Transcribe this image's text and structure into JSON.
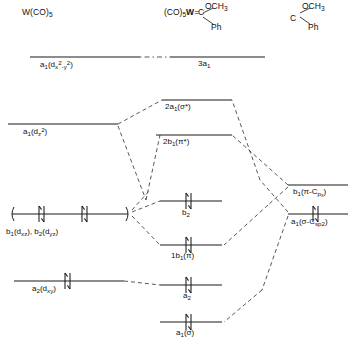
{
  "figure": {
    "type": "molecular-orbital-correlation-diagram",
    "columns": [
      {
        "id": "left",
        "header_html": "W(CO)<sub>5</sub>",
        "header_text": "W(CO)5"
      },
      {
        "id": "center",
        "header_text": "(CO)5W=C(OCH3)Ph"
      },
      {
        "id": "right",
        "header_text": "C(OCH3)Ph"
      }
    ]
  },
  "fragments": {
    "center": {
      "left_group": "(CO)",
      "left_sub": "5",
      "metal": "W",
      "bond": "double",
      "carbon": "C",
      "upper_substituent": "OCH",
      "upper_sub": "3",
      "lower_substituent": "Ph"
    },
    "right": {
      "carbon": "C",
      "upper_substituent": "OCH",
      "upper_sub": "3",
      "lower_substituent": "Ph"
    }
  },
  "levels": {
    "left": [
      {
        "key": "l1",
        "label_text": "a1(dx2-y2)",
        "y": 57,
        "x1": 30,
        "x2": 140,
        "electrons": 0
      },
      {
        "key": "l2",
        "label_text": "a1(dz2)",
        "y": 124,
        "x1": 8,
        "x2": 118,
        "electrons": 0
      },
      {
        "key": "l3",
        "label_text": "b1(dxz), b2(dyz)",
        "y": 214,
        "x1": 8,
        "x2": 130,
        "electrons": 4
      },
      {
        "key": "l4",
        "label_text": "a2(dxy)",
        "y": 281,
        "x1": 14,
        "x2": 124,
        "electrons": 2
      }
    ],
    "center": [
      {
        "key": "c1",
        "label_text": "3a1",
        "y": 57,
        "x1": 170,
        "x2": 265,
        "electrons": 0
      },
      {
        "key": "c2",
        "label_text": "2a1(σ*)",
        "y": 100,
        "x1": 162,
        "x2": 232,
        "electrons": 0
      },
      {
        "key": "c3",
        "label_text": "2b1(π*)",
        "y": 135,
        "x1": 156,
        "x2": 232,
        "electrons": 0
      },
      {
        "key": "c4",
        "label_text": "b2",
        "y": 201,
        "x1": 160,
        "x2": 222,
        "electrons": 2
      },
      {
        "key": "c5",
        "label_text": "1b1(π)",
        "y": 245,
        "x1": 160,
        "x2": 222,
        "electrons": 2
      },
      {
        "key": "c6",
        "label_text": "a2",
        "y": 285,
        "x1": 160,
        "x2": 222,
        "electrons": 2
      },
      {
        "key": "c7",
        "label_text": "a1(σ)",
        "y": 322,
        "x1": 160,
        "x2": 222,
        "electrons": 2
      }
    ],
    "right": [
      {
        "key": "r1",
        "label_text": "b1(π-Cpx)",
        "y": 185,
        "x1": 288,
        "x2": 348,
        "electrons": 0
      },
      {
        "key": "r2",
        "label_text": "a1(σ-Csp2)",
        "y": 214,
        "x1": 288,
        "x2": 348,
        "electrons": 2
      }
    ]
  },
  "correlations": [
    {
      "from": "l1",
      "to": "c1",
      "style": "dash-dot"
    },
    {
      "from": "l2",
      "to": "c2",
      "style": "dashed"
    },
    {
      "from": "l2",
      "to": "c5",
      "style": "dashed"
    },
    {
      "from": "l3",
      "to": "c3",
      "style": "dashed"
    },
    {
      "from": "l3",
      "to": "c4",
      "style": "dashed"
    },
    {
      "from": "l3",
      "to": "c5",
      "style": "dashed"
    },
    {
      "from": "l4",
      "to": "c6",
      "style": "dashed"
    },
    {
      "from": "r1",
      "to": "c3",
      "style": "dashed"
    },
    {
      "from": "r1",
      "to": "c5",
      "style": "dashed"
    },
    {
      "from": "r2",
      "to": "c2",
      "style": "dashed"
    },
    {
      "from": "r2",
      "to": "c7",
      "style": "dashed"
    }
  ],
  "colors": {
    "line": "#2a2a2a",
    "background": "#ffffff",
    "text": "#111111"
  }
}
